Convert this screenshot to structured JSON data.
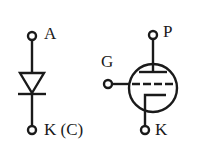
{
  "diagram": {
    "diode": {
      "symbol": "diode-icon",
      "anode_label": "A",
      "cathode_label": "K (C)"
    },
    "tube": {
      "symbol": "vacuum-triode-icon",
      "plate_label": "P",
      "grid_label": "G",
      "cathode_label": "K"
    },
    "stroke_color": "#1a1a1a",
    "background_color": "#ffffff"
  }
}
